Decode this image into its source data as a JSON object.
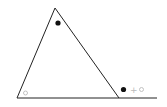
{
  "diagram": {
    "colors": {
      "line": "#222222",
      "filled_marker": "#111111",
      "open_marker": "#bbbbbb",
      "plus": "#bbbbbb",
      "background": "#ffffff"
    },
    "triangle": {
      "apex": [
        55,
        8
      ],
      "bottom_left": [
        17,
        98
      ],
      "bottom_right": [
        119,
        98
      ]
    },
    "baseline_extension_end": [
      157,
      98
    ],
    "markers": [
      {
        "id": "apex-angle",
        "type": "filled-circle",
        "position": [
          58,
          23
        ],
        "meaning": "interior angle at apex"
      },
      {
        "id": "bottom-left-angle",
        "type": "open-circle",
        "position": [
          25,
          93
        ],
        "meaning": "interior angle at bottom-left"
      }
    ],
    "exterior_angle_label": {
      "position": [
        122,
        89
      ],
      "parts": [
        "filled-circle",
        "+",
        "open-circle"
      ],
      "plus_text": "+"
    }
  }
}
